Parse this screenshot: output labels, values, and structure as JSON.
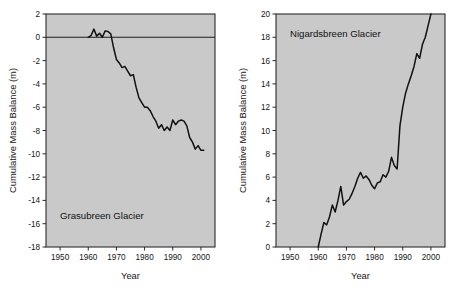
{
  "figure": {
    "background_color": "#ffffff",
    "plot_background_color": "#c9c9c9",
    "line_color": "#111111",
    "axis_color": "#2a2a2a"
  },
  "chart_data": [
    {
      "type": "line",
      "title": "Grasubreen Glacier",
      "xlabel": "Year",
      "ylabel": "Cumulative Mass Balance (m)",
      "xlim": [
        1945,
        2005
      ],
      "ylim": [
        -18,
        2
      ],
      "xticks": [
        1950,
        1960,
        1970,
        1980,
        1990,
        2000
      ],
      "yticks": [
        2,
        0,
        -2,
        -4,
        -6,
        -8,
        -10,
        -12,
        -14,
        -16,
        -18
      ],
      "grid": false,
      "legend": "none",
      "zero_reference_line": 0,
      "series": [
        {
          "name": "Grasubreen cumulative mass balance",
          "x": [
            1960,
            1961,
            1962,
            1963,
            1964,
            1965,
            1966,
            1967,
            1968,
            1969,
            1970,
            1971,
            1972,
            1973,
            1974,
            1975,
            1976,
            1977,
            1978,
            1979,
            1980,
            1981,
            1982,
            1983,
            1984,
            1985,
            1986,
            1987,
            1988,
            1989,
            1990,
            1991,
            1992,
            1993,
            1994,
            1995,
            1996,
            1997,
            1998,
            1999,
            2000,
            2001
          ],
          "values": [
            0.0,
            0.15,
            0.7,
            0.1,
            0.35,
            0.0,
            0.55,
            0.5,
            0.3,
            -0.9,
            -1.9,
            -2.2,
            -2.6,
            -2.5,
            -2.9,
            -3.3,
            -3.2,
            -4.3,
            -5.2,
            -5.6,
            -6.0,
            -6.0,
            -6.3,
            -6.8,
            -7.2,
            -7.8,
            -7.5,
            -8.0,
            -7.7,
            -8.0,
            -7.1,
            -7.5,
            -7.2,
            -7.1,
            -7.2,
            -7.6,
            -8.6,
            -9.0,
            -9.6,
            -9.3,
            -9.7,
            -9.7
          ]
        }
      ]
    },
    {
      "type": "line",
      "title": "Nigardsbreen Glacier",
      "xlabel": "Year",
      "ylabel": "Cumulative Mass Balance (m)",
      "xlim": [
        1945,
        2005
      ],
      "ylim": [
        0,
        20
      ],
      "xticks": [
        1950,
        1960,
        1970,
        1980,
        1990,
        2000
      ],
      "yticks": [
        20,
        18,
        16,
        14,
        12,
        10,
        8,
        6,
        4,
        2,
        0
      ],
      "grid": false,
      "legend": "none",
      "series": [
        {
          "name": "Nigardsbreen cumulative mass balance",
          "x": [
            1960,
            1961,
            1962,
            1963,
            1964,
            1965,
            1966,
            1967,
            1968,
            1969,
            1970,
            1971,
            1972,
            1973,
            1974,
            1975,
            1976,
            1977,
            1978,
            1979,
            1980,
            1981,
            1982,
            1983,
            1984,
            1985,
            1986,
            1987,
            1988,
            1989,
            1990,
            1991,
            1992,
            1993,
            1994,
            1995,
            1996,
            1997,
            1998,
            1999,
            2000
          ],
          "values": [
            0.0,
            1.1,
            2.1,
            1.9,
            2.6,
            3.6,
            3.0,
            4.0,
            5.2,
            3.6,
            3.9,
            4.1,
            4.6,
            5.2,
            5.9,
            6.4,
            5.9,
            6.1,
            5.8,
            5.3,
            5.0,
            5.5,
            5.6,
            6.2,
            6.0,
            6.5,
            7.7,
            7.0,
            6.7,
            10.4,
            12.0,
            13.2,
            14.0,
            14.7,
            15.5,
            16.6,
            16.2,
            17.4,
            18.0,
            19.0,
            20.0
          ]
        }
      ]
    }
  ]
}
